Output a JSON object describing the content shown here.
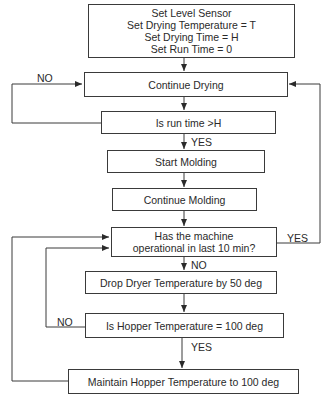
{
  "diagram": {
    "type": "flowchart",
    "nodes": {
      "init": {
        "lines": [
          "Set Level Sensor",
          "Set Drying Temperature = T",
          "Set Drying Time = H",
          "Set Run Time = 0"
        ]
      },
      "continue_drying": {
        "label": "Continue Drying"
      },
      "run_time_check": {
        "label": "Is run time >H"
      },
      "start_molding": {
        "label": "Start Molding"
      },
      "continue_molding": {
        "label": "Continue Molding"
      },
      "operational_check": {
        "lines": [
          "Has the machine",
          "operational in last 10 min?"
        ]
      },
      "drop_temp": {
        "label": "Drop Dryer Temperature by 50 deg"
      },
      "hopper_check": {
        "label": "Is Hopper Temperature = 100 deg"
      },
      "maintain_temp": {
        "label": "Maintain Hopper Temperature to 100 deg"
      }
    },
    "edge_labels": {
      "run_time_no": "NO",
      "run_time_yes": "YES",
      "operational_yes": "YES",
      "operational_no": "NO",
      "hopper_no": "NO",
      "hopper_yes": "YES"
    },
    "edges": [
      {
        "from": "init",
        "to": "continue_drying"
      },
      {
        "from": "continue_drying",
        "to": "run_time_check"
      },
      {
        "from": "run_time_check",
        "to": "continue_drying",
        "label": "NO"
      },
      {
        "from": "run_time_check",
        "to": "start_molding",
        "label": "YES"
      },
      {
        "from": "start_molding",
        "to": "continue_molding"
      },
      {
        "from": "continue_molding",
        "to": "operational_check"
      },
      {
        "from": "operational_check",
        "to": "continue_drying",
        "label": "YES"
      },
      {
        "from": "operational_check",
        "to": "drop_temp",
        "label": "NO"
      },
      {
        "from": "drop_temp",
        "to": "hopper_check"
      },
      {
        "from": "hopper_check",
        "to": "operational_check",
        "label": "NO"
      },
      {
        "from": "hopper_check",
        "to": "maintain_temp",
        "label": "YES"
      },
      {
        "from": "maintain_temp",
        "to": "operational_check"
      }
    ],
    "colors": {
      "line": "#3a3a3a",
      "text": "#2a2a2a",
      "background": "#ffffff"
    }
  }
}
